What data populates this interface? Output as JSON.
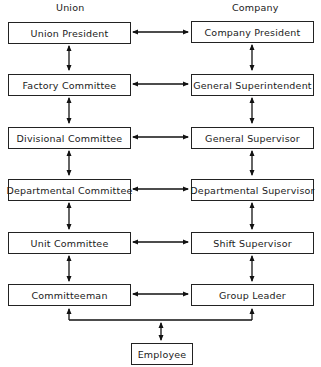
{
  "headers": {
    "union": "Union",
    "company": "Company"
  },
  "union": [
    "Union President",
    "Factory Committee",
    "Divisional Committee",
    "Departmental Committee",
    "Unit Committee",
    "Committeeman"
  ],
  "company": [
    "Company President",
    "General Superintendent",
    "General Supervisor",
    "Departmental Supervisor",
    "Shift Supervisor",
    "Group Leader"
  ],
  "bottom": "Employee"
}
